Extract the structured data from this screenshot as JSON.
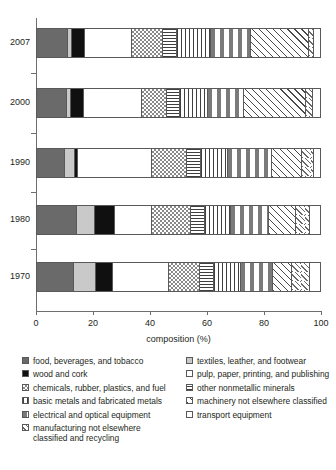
{
  "chart_data": {
    "type": "bar",
    "orientation": "horizontal",
    "stacked": true,
    "title": "",
    "xlabel": "composition (%)",
    "ylabel": "",
    "xlim": [
      0,
      100
    ],
    "xticks": [
      0,
      20,
      40,
      60,
      80,
      100
    ],
    "xtick_labels": [
      "0",
      "20",
      "40",
      "60",
      "80",
      "100"
    ],
    "grid": false,
    "legend_position": "below",
    "categories": [
      "2007",
      "2000",
      "1990",
      "1980",
      "1970"
    ],
    "series": [
      {
        "name": "food, beverages, and tobacco",
        "pattern": "solid-dark-gray",
        "values": [
          11.0,
          10.5,
          10.0,
          14.0,
          13.0
        ]
      },
      {
        "name": "textiles, leather, and footwear",
        "pattern": "solid-light-gray",
        "values": [
          1.5,
          1.5,
          3.5,
          6.5,
          8.0
        ]
      },
      {
        "name": "wood and cork",
        "pattern": "solid-black",
        "values": [
          4.5,
          4.5,
          1.0,
          7.0,
          6.0
        ]
      },
      {
        "name": "pulp, paper, printing, and publishing",
        "pattern": "white",
        "values": [
          16.5,
          20.5,
          26.0,
          13.0,
          19.5
        ]
      },
      {
        "name": "chemicals, rubber, plastics, and fuel",
        "pattern": "checkerboard",
        "values": [
          11.0,
          9.0,
          12.5,
          14.0,
          11.0
        ]
      },
      {
        "name": "other nonmetallic minerals",
        "pattern": "horizontal-lines",
        "values": [
          5.0,
          4.5,
          5.0,
          5.0,
          5.0
        ]
      },
      {
        "name": "basic metals and fabricated metals",
        "pattern": "vertical-lines",
        "values": [
          12.0,
          10.0,
          9.5,
          9.0,
          9.5
        ]
      },
      {
        "name": "electrical and optical equipment",
        "pattern": "dashes",
        "values": [
          14.0,
          12.5,
          15.5,
          13.5,
          11.5
        ]
      },
      {
        "name": "machinery not elsewhere classified",
        "pattern": "diagonal-hatch",
        "values": [
          20.5,
          22.0,
          10.5,
          9.5,
          6.5
        ]
      },
      {
        "name": "manufacturing not elsewhere classified and recycling",
        "pattern": "sparse-diagonal",
        "values": [
          2.0,
          2.5,
          4.5,
          5.0,
          6.5
        ]
      },
      {
        "name": "transport equipment",
        "pattern": "white-plain",
        "values": [
          2.0,
          2.5,
          2.0,
          3.5,
          3.5
        ]
      }
    ]
  },
  "axis": {
    "x_title": "composition (%)",
    "ticks": [
      {
        "value": 0,
        "label": "0"
      },
      {
        "value": 20,
        "label": "20"
      },
      {
        "value": 40,
        "label": "40"
      },
      {
        "value": 60,
        "label": "60"
      },
      {
        "value": 80,
        "label": "80"
      },
      {
        "value": 100,
        "label": "100"
      }
    ],
    "years": [
      "2007",
      "2000",
      "1990",
      "1980",
      "1970"
    ]
  },
  "legend": {
    "left_column": [
      {
        "label": "food, beverages, and tobacco",
        "swatch": "solid-dark-gray"
      },
      {
        "label": "wood and cork",
        "swatch": "solid-black"
      },
      {
        "label": "chemicals, rubber, plastics, and fuel",
        "swatch": "checkerboard"
      },
      {
        "label": "basic metals and fabricated metals",
        "swatch": "vertical-lines"
      },
      {
        "label": "electrical and optical equipment",
        "swatch": "dashes"
      },
      {
        "label": "manufacturing not elsewhere",
        "label2": "classified and recycling",
        "swatch": "sparse-diagonal"
      }
    ],
    "right_column": [
      {
        "label": "textiles, leather, and footwear",
        "swatch": "solid-light-gray"
      },
      {
        "label": "pulp, paper, printing, and publishing",
        "swatch": "white"
      },
      {
        "label": "other nonmetallic minerals",
        "swatch": "horizontal-lines"
      },
      {
        "label": "machinery not elsewhere classified",
        "swatch": "diagonal-hatch"
      },
      {
        "label": "transport equipment",
        "swatch": "white-plain"
      }
    ]
  }
}
